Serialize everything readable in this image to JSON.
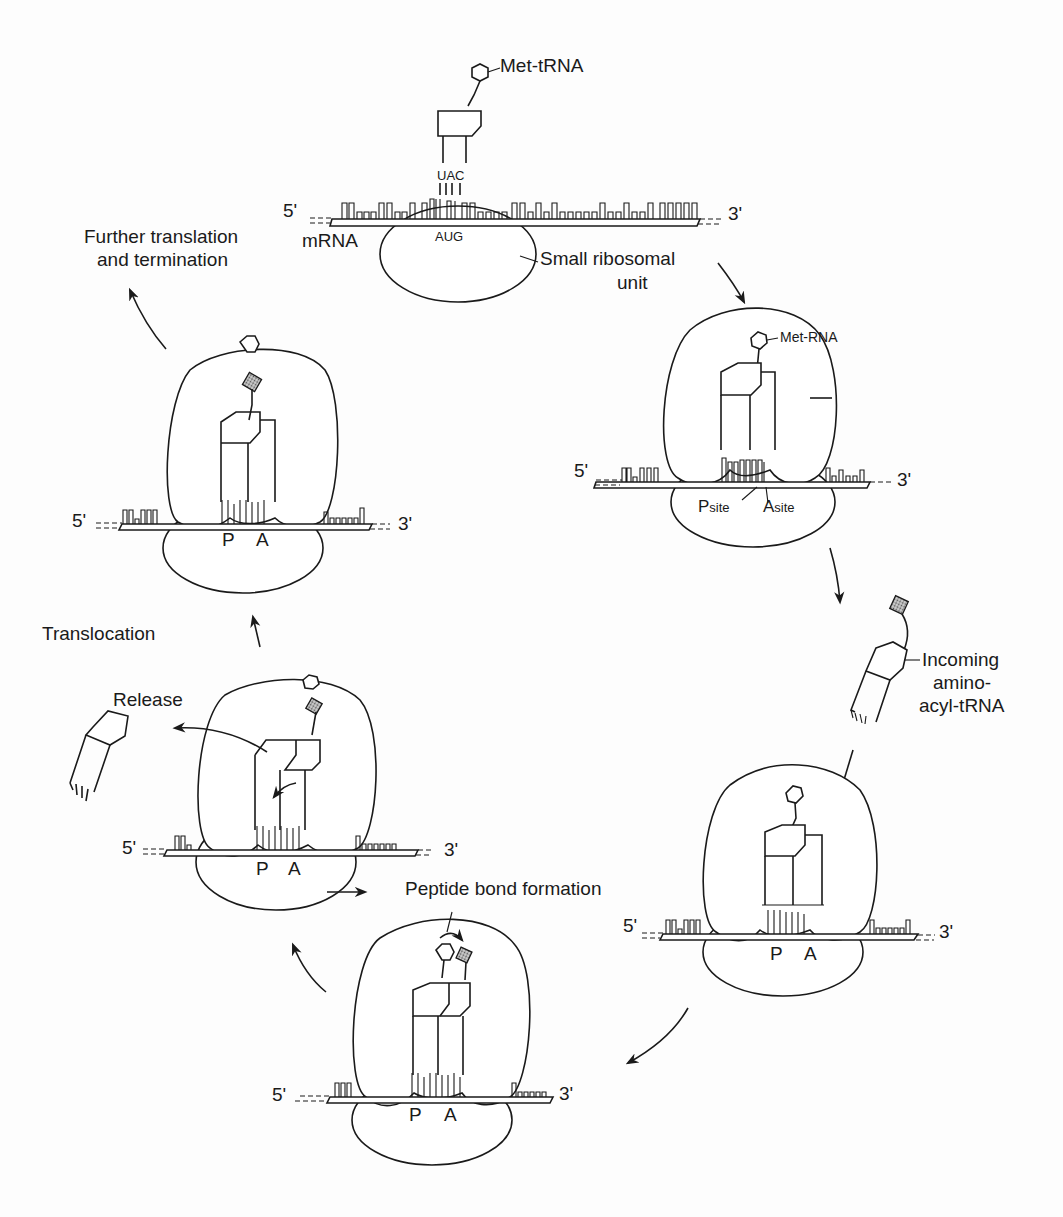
{
  "figure": {
    "colors": {
      "ink": "#1a1a1a",
      "background": "#fdfdfd",
      "amino_acid_fill": "#9a9a9a"
    }
  },
  "stages": {
    "initiation": {
      "tRNA_label": "Met-tRNA",
      "anticodon": "UAC",
      "codon": "AUG",
      "five_prime": "5'",
      "three_prime": "3'",
      "mrna_label": "mRNA",
      "small_subunit_label_line1": "Small ribosomal",
      "small_subunit_label_line2": "unit"
    },
    "assembled": {
      "tRNA_label": "Met-RNA",
      "five_prime": "5'",
      "three_prime": "3'",
      "p_site_main": "P",
      "p_site_sub": "site",
      "a_site_main": "A",
      "a_site_sub": "site"
    },
    "incoming": {
      "label_line1": "Incoming",
      "label_line2": "amino-",
      "label_line3": "acyl-tRNA",
      "five_prime": "5'",
      "three_prime": "3'",
      "p_site": "P",
      "a_site": "A"
    },
    "peptide_bond": {
      "label": "Peptide bond formation",
      "five_prime": "5'",
      "three_prime": "3'",
      "p_site": "P",
      "a_site": "A"
    },
    "release": {
      "label": "Release",
      "five_prime": "5'",
      "three_prime": "3'",
      "p_site": "P",
      "a_site": "A"
    },
    "translocation": {
      "label": "Translocation"
    },
    "further": {
      "label_line1": "Further translation",
      "label_line2": "and termination",
      "five_prime": "5'",
      "three_prime": "3'",
      "p_site": "P",
      "a_site": "A"
    }
  }
}
